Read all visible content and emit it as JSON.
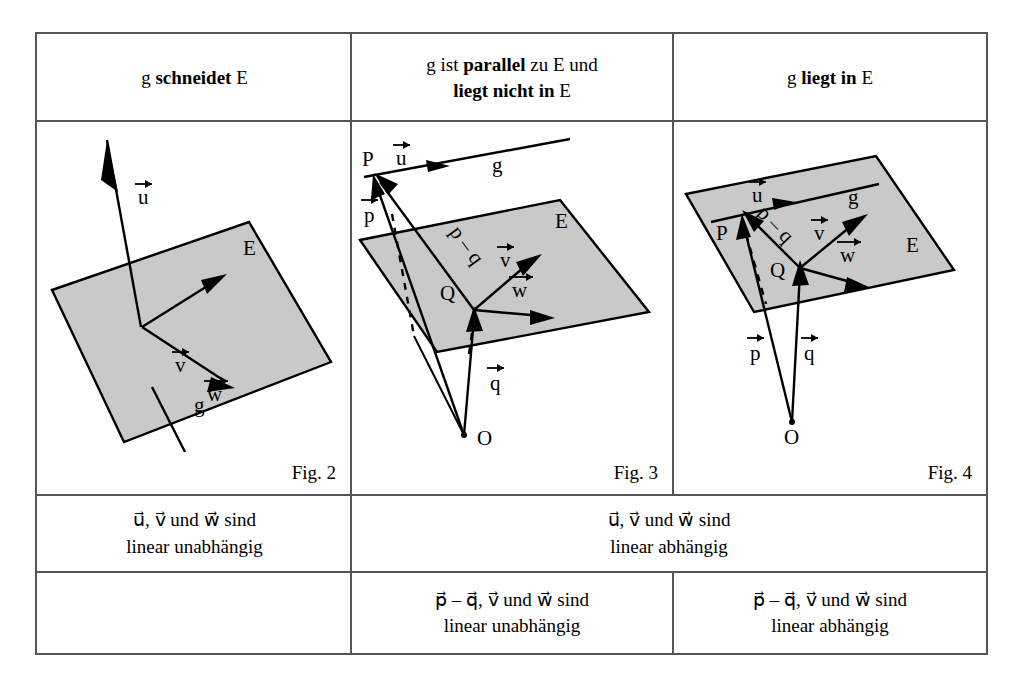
{
  "figure": {
    "type": "diagram",
    "topic": "Lagebeziehung Gerade g und Ebene E",
    "table": {
      "columns": 3,
      "header_row": [
        {
          "plain_before": "g ",
          "bold": "schneidet",
          "plain_after": " E"
        },
        {
          "line1_before": "g ist ",
          "line1_bold": "parallel",
          "line1_after": " zu E und",
          "line2_bold": "liegt nicht in",
          "line2_after": " E"
        },
        {
          "plain_before": "g ",
          "bold": "liegt in",
          "plain_after": " E"
        }
      ],
      "figure_row": [
        {
          "caption": "Fig. 2"
        },
        {
          "caption": "Fig. 3"
        },
        {
          "caption": "Fig. 4"
        }
      ],
      "row3": [
        {
          "line1": "u⃗, v⃗ und w⃗ sind",
          "line2": "linear unabhängig",
          "colspan": 1
        },
        {
          "line1": "u⃗, v⃗ und w⃗ sind",
          "line2": "linear abhängig",
          "colspan": 2
        }
      ],
      "row4": [
        {
          "line1": "",
          "line2": "",
          "colspan": 1
        },
        {
          "line1": "p⃗ – q⃗, v⃗ und w⃗ sind",
          "line2": "linear unabhängig",
          "colspan": 1
        },
        {
          "line1": "p⃗ – q⃗, v⃗ und w⃗ sind",
          "line2": "linear abhängig",
          "colspan": 1
        }
      ]
    },
    "labels": {
      "E": "E",
      "g": "g",
      "u": "u",
      "v": "v",
      "w": "w",
      "p": "p",
      "q": "q",
      "p_minus_q": "p – q",
      "P": "P",
      "Q": "Q",
      "O": "O"
    },
    "colors": {
      "plane_fill": "#c9c9c9",
      "stroke": "#000000",
      "rule": "#555555",
      "background": "#ffffff"
    }
  }
}
